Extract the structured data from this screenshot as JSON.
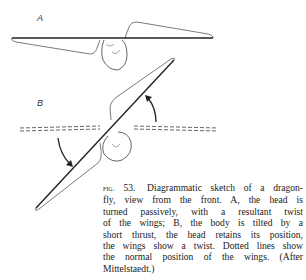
{
  "figure": {
    "panels": [
      {
        "label": "A",
        "description": "Head turned passively with resultant twist of the wings"
      },
      {
        "label": "B",
        "description": "Body tilted by short thrust, head retains position, wings show twist; dotted lines show normal wing position"
      }
    ]
  },
  "caption": {
    "fig_label": "fig.",
    "fig_number": "53.",
    "lines": [
      "Diagrammatic sketch of a dragon-",
      "fly, view from the front. A, the head is",
      "turned passively, with a resultant twist",
      "of the wings; B, the body is tilted by a",
      "short thrust, the head retains its position,",
      "the wings show a twist. Dotted lines show",
      "the normal position of the wings. (After",
      "Mittelstaedt.)"
    ]
  }
}
